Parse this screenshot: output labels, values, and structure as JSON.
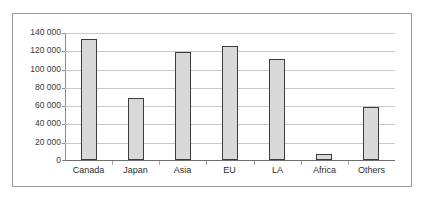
{
  "chart_data": {
    "type": "bar",
    "title": "",
    "xlabel": "",
    "ylabel": "",
    "categories": [
      "Canada",
      "Japan",
      "Asia",
      "EU",
      "LA",
      "Africa",
      "Others"
    ],
    "values": [
      132000,
      68000,
      118000,
      125000,
      110000,
      7000,
      58000
    ],
    "ylim": [
      0,
      140000
    ],
    "ytick_step": 20000,
    "ytick_labels": [
      "140 000",
      "120 000",
      "100 000",
      "80 000",
      "60 000",
      "40 000",
      "20 000",
      "0"
    ],
    "ytick_values": [
      140000,
      120000,
      100000,
      80000,
      60000,
      40000,
      20000,
      0
    ],
    "grid": true,
    "legend": false,
    "bar_fill_color": "#d9d9d9",
    "bar_border_color": "#3c3c3c",
    "gridline_color": "#c9c9c9",
    "frame_color": "#9a9a9a",
    "background_color": "#ffffff"
  }
}
